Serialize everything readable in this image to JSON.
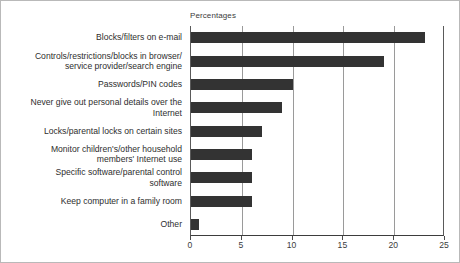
{
  "header": {
    "axis_note": "Percentages"
  },
  "chart_data": {
    "type": "bar",
    "orientation": "horizontal",
    "title": "",
    "subtitle": "",
    "xlabel": "Percentages",
    "ylabel": "",
    "xlim": [
      0,
      25
    ],
    "xticks": [
      0,
      5,
      10,
      15,
      20,
      25
    ],
    "tick_labels": [
      "0",
      "5",
      "10",
      "15",
      "20",
      "25"
    ],
    "grid": "vertical",
    "legend": "none",
    "bar_color": "#333333",
    "background_color": "#ffffff",
    "axis_color": "#3d3d3d",
    "gridline_color": "#9a9a9a",
    "categories": [
      "Blocks/filters on e-mail",
      "Controls/restrictions/blocks in browser/\nservice provider/search engine",
      "Passwords/PIN codes",
      "Never give out personal details over the\nInternet",
      "Locks/parental locks on certain sites",
      "Monitor children's/other household\nmembers' Internet use",
      "Specific software/parental control\nsoftware",
      "Keep computer in a family room",
      "Other"
    ],
    "values": [
      23,
      19,
      10,
      9,
      7,
      6,
      6,
      6,
      0.8
    ]
  }
}
